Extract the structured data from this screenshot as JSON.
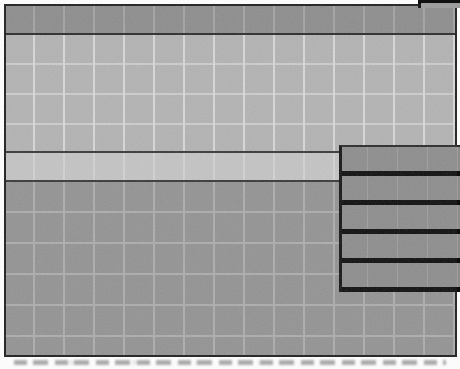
{
  "meta": {
    "width_px": 460,
    "height_px": 369,
    "legible_text": ""
  },
  "colors": {
    "page_bg": "#fbfbfb",
    "window_border": "#1e1e1e",
    "titlebar_fill": "#8d8d8d",
    "upper_fill": "#b3b3b3",
    "upper_grid_line": "#d8d8d8",
    "band_fill": "#c4c4c4",
    "band_border": "#383838",
    "lower_fill": "#939393",
    "lower_grid_line": "#adadad",
    "panel_fill": "#8d8d8d",
    "panel_stripe": "#0d0d0d",
    "tab_fill": "#9c9c9c",
    "caption_ink": "#9f9f9f"
  },
  "layout_facts": {
    "grid_cell_px": 30,
    "titlebar_height_px": 27,
    "band_top_px": 151,
    "band_height_px": 31,
    "panel_left_px": 345,
    "panel_top_px": 149,
    "panel_bottom_px": 296
  },
  "window": {
    "titlebar": {
      "title": ""
    },
    "panel": {
      "row_count": 5
    }
  }
}
